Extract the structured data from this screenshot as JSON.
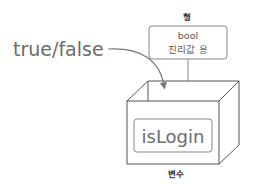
{
  "diagram": {
    "type_header": "형",
    "type_box": {
      "line1": "bool",
      "line2": "진리값 용"
    },
    "value_label": "true/false",
    "variable_name": "isLogin",
    "variable_caption": "변수",
    "colors": {
      "line": "#555555",
      "text": "#6b6b6b",
      "arrow": "#777777",
      "background": "#ffffff"
    }
  }
}
